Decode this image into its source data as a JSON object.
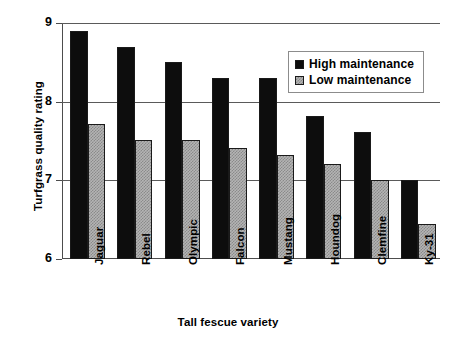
{
  "chart_data": {
    "type": "bar",
    "title": "",
    "xlabel": "Tall fescue variety",
    "ylabel": "Turfgrass quality rating",
    "categories": [
      "Jaguar",
      "Rebel",
      "Olympic",
      "Falcon",
      "Mustang",
      "Houndog",
      "Clemfine",
      "Ky-31"
    ],
    "series": [
      {
        "name": "High maintenance",
        "color": "#0d0d0d",
        "values": [
          8.9,
          8.69,
          8.5,
          8.3,
          8.3,
          7.82,
          7.62,
          7.0
        ]
      },
      {
        "name": "Low maintenance",
        "color": "#b4b4b4",
        "values": [
          7.71,
          7.51,
          7.51,
          7.41,
          7.32,
          7.21,
          7.01,
          6.44
        ]
      }
    ],
    "ylim": [
      6,
      9
    ],
    "yticks": [
      6,
      7,
      8,
      9
    ],
    "ytick_labels": [
      "6",
      "7",
      "8",
      "9"
    ],
    "grid": "horizontal",
    "legend_position": "top-right",
    "legend_entries": [
      "High maintenance",
      "Low maintenance"
    ]
  },
  "axes": {
    "y_title": "Turfgrass quality rating",
    "x_title": "Tall fescue variety"
  },
  "legend": {
    "high_label": "High maintenance",
    "low_label": "Low maintenance"
  },
  "colors": {
    "high_maintenance": "#0d0d0d",
    "low_maintenance": "#b4b4b4",
    "axis": "#4d4d4d",
    "grid": "#5a5a5a",
    "background": "#ffffff"
  }
}
